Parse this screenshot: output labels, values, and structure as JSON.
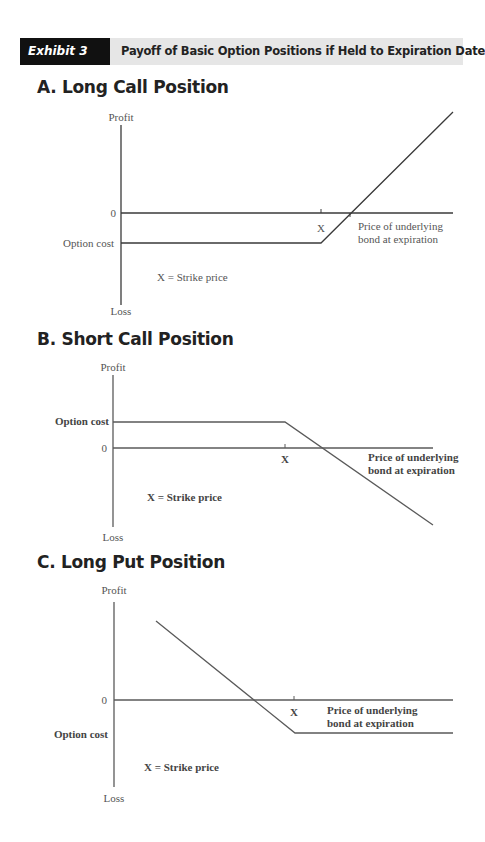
{
  "header": {
    "tag": "Exhibit 3",
    "title": "Payoff of Basic Option Positions if Held to Expiration Date"
  },
  "panels": [
    {
      "title": "A.  Long Call Position"
    },
    {
      "title": "B.  Short Call Position"
    },
    {
      "title": "C.  Long Put Position"
    }
  ],
  "chart_data": [
    {
      "type": "line",
      "title": "A. Long Call Position",
      "ylabel_top": "Profit",
      "ylabel_bottom": "Loss",
      "xlabel": [
        "Price of underlying",
        "bond at expiration"
      ],
      "zero_label": "0",
      "option_cost_label": "Option cost",
      "strike_label": "X",
      "legend_note": "X = Strike price",
      "strike_x": 200,
      "breakeven_x": 229,
      "option_cost": -30,
      "axis": {
        "ymax": 88,
        "ymin": -92,
        "xmax": 332
      },
      "points": [
        [
          0,
          -30
        ],
        [
          200,
          -30
        ],
        [
          332,
          101
        ]
      ],
      "origin_px": [
        121,
        213
      ],
      "bold_labels": false,
      "line_color": "#3a3a3a"
    },
    {
      "type": "line",
      "title": "B. Short Call Position",
      "ylabel_top": "Profit",
      "ylabel_bottom": "Loss",
      "xlabel": [
        "Price of underlying",
        "bond at expiration"
      ],
      "zero_label": "0",
      "option_cost_label": "Option cost",
      "strike_label": "X",
      "legend_note": "X = Strike price",
      "strike_x": 172,
      "option_cost": 26,
      "axis": {
        "ymax": 73,
        "ymin": -79,
        "xmax": 320
      },
      "points": [
        [
          0,
          26
        ],
        [
          172,
          26
        ],
        [
          320,
          -77
        ]
      ],
      "origin_px": [
        113,
        448
      ],
      "bold_labels": true,
      "line_color": "#5a5a5a"
    },
    {
      "type": "line",
      "title": "C. Long Put Position",
      "ylabel_top": "Profit",
      "ylabel_bottom": "Loss",
      "xlabel": [
        "Price of underlying",
        "bond at expiration"
      ],
      "zero_label": "0",
      "option_cost_label": "Option cost",
      "strike_label": "X",
      "legend_note": "X = Strike price",
      "strike_x": 180,
      "option_cost": -33,
      "axis": {
        "ymax": 98,
        "ymin": -87,
        "xmax": 339
      },
      "points": [
        [
          42,
          79
        ],
        [
          181,
          -33
        ],
        [
          339,
          -33
        ]
      ],
      "origin_px": [
        114,
        700
      ],
      "bold_labels": true,
      "line_color": "#5a5a5a"
    }
  ]
}
